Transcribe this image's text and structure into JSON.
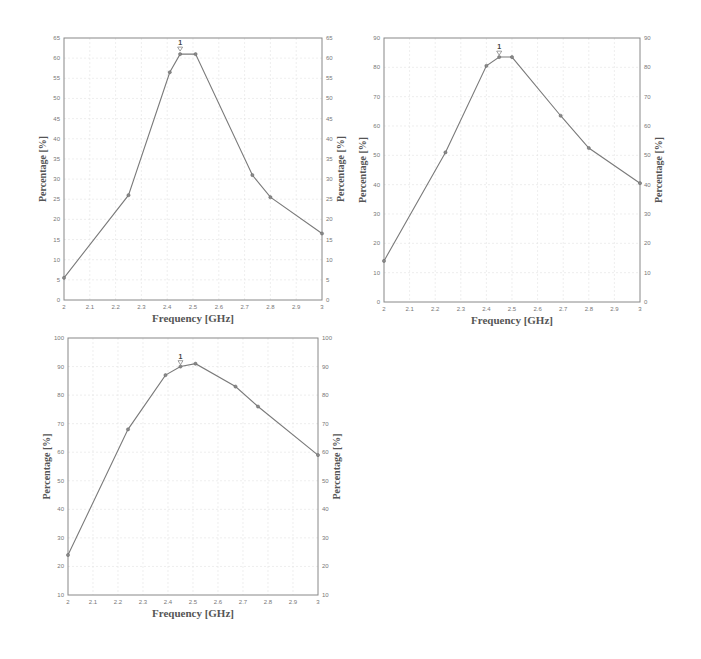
{
  "chart_data": [
    {
      "type": "line",
      "title": "",
      "xlabel": "Frequency [GHz]",
      "ylabel": "Percentage [%]",
      "ylabel_right": "Percentage [%]",
      "xlim": [
        2,
        3
      ],
      "ylim": [
        0,
        65
      ],
      "xticks": [
        "2",
        "2.1",
        "2.2",
        "2.3",
        "2.4",
        "2.5",
        "2.6",
        "2.7",
        "2.8",
        "2.9",
        "3"
      ],
      "yticks": [
        "0",
        "5",
        "10",
        "15",
        "20",
        "25",
        "30",
        "35",
        "40",
        "45",
        "50",
        "55",
        "60",
        "65"
      ],
      "grid": true,
      "x": [
        2.0,
        2.25,
        2.41,
        2.45,
        2.51,
        2.73,
        2.8,
        3.0
      ],
      "series": [
        {
          "name": "Percentage",
          "values": [
            5.5,
            26,
            56.5,
            61,
            61,
            31,
            25.5,
            16.5
          ]
        }
      ],
      "marker": {
        "label": "1",
        "x": 2.45,
        "y": 62
      }
    },
    {
      "type": "line",
      "title": "",
      "xlabel": "Frequency [GHz]",
      "ylabel": "Percentage [%]",
      "ylabel_right": "Percentage [%]",
      "xlim": [
        2,
        3
      ],
      "ylim": [
        0,
        90
      ],
      "xticks": [
        "2",
        "2.1",
        "2.2",
        "2.3",
        "2.4",
        "2.5",
        "2.6",
        "2.7",
        "2.8",
        "2.9",
        "3"
      ],
      "yticks": [
        "0",
        "10",
        "20",
        "30",
        "40",
        "50",
        "60",
        "70",
        "80",
        "90"
      ],
      "grid": true,
      "x": [
        2.0,
        2.24,
        2.4,
        2.45,
        2.5,
        2.69,
        2.8,
        3.0
      ],
      "series": [
        {
          "name": "Percentage",
          "values": [
            14,
            51,
            80.5,
            83.5,
            83.5,
            63.5,
            52.5,
            40.5
          ]
        }
      ],
      "marker": {
        "label": "1",
        "x": 2.45,
        "y": 84.5
      }
    },
    {
      "type": "line",
      "title": "",
      "xlabel": "Frequency [GHz]",
      "ylabel": "Percentage [%]",
      "ylabel_right": "Percentage [%]",
      "xlim": [
        2,
        3
      ],
      "ylim": [
        10,
        100
      ],
      "xticks": [
        "2",
        "2.1",
        "2.2",
        "2.3",
        "2.4",
        "2.5",
        "2.6",
        "2.7",
        "2.8",
        "2.9",
        "3"
      ],
      "yticks": [
        "10",
        "20",
        "30",
        "40",
        "50",
        "60",
        "70",
        "80",
        "90",
        "100"
      ],
      "grid": true,
      "x": [
        2.0,
        2.24,
        2.39,
        2.45,
        2.51,
        2.67,
        2.76,
        3.0
      ],
      "series": [
        {
          "name": "Percentage",
          "values": [
            24,
            68,
            87,
            90,
            91,
            83,
            76,
            59
          ]
        }
      ],
      "marker": {
        "label": "1",
        "x": 2.45,
        "y": 91
      }
    }
  ]
}
